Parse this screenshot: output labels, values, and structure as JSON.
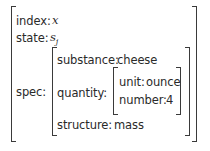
{
  "avm": {
    "features": [
      {
        "attr": "index",
        "value": "x",
        "value_type": "math"
      },
      {
        "attr": "state",
        "value": "s",
        "value_subscript": "j",
        "value_type": "math"
      },
      {
        "attr": "spec",
        "value_type": "avm",
        "features": [
          {
            "attr": "substance",
            "value": "cheese"
          },
          {
            "attr": "quantity",
            "value_type": "avm",
            "features": [
              {
                "attr": "unit",
                "value": "ounce"
              },
              {
                "attr": "number",
                "value": "4"
              }
            ]
          },
          {
            "attr": "structure",
            "value": "mass"
          }
        ]
      }
    ]
  },
  "labels": {
    "index": "index:",
    "index_val": "x",
    "state": "state:",
    "state_val": "s",
    "state_sub": "j",
    "spec": "spec:",
    "substance": "substance:",
    "substance_val": "cheese",
    "quantity": "quantity:",
    "unit": "unit:",
    "unit_val": "ounce",
    "number": "number:",
    "number_val": "4",
    "structure": "structure:",
    "structure_val": "mass"
  }
}
